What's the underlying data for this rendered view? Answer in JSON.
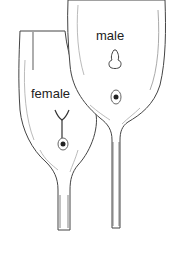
{
  "diagram": {
    "labels": {
      "male": "male",
      "female": "female"
    },
    "colors": {
      "outline": "#333333",
      "shade": "#9a9a9a",
      "fill": "#ffffff",
      "text": "#222222"
    }
  }
}
